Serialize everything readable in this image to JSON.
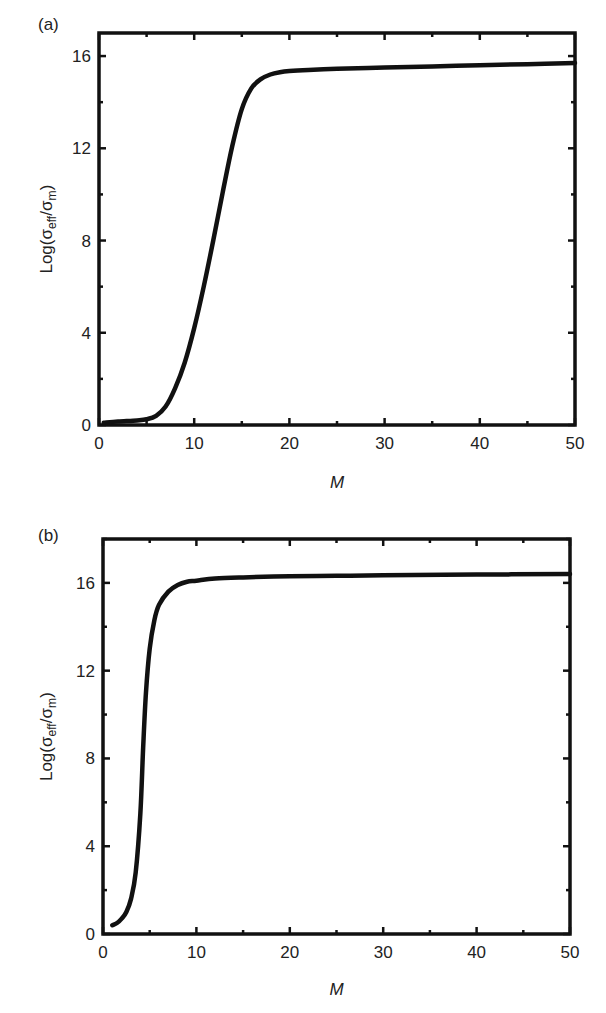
{
  "chart_data": [
    {
      "panel_label": "(a)",
      "type": "line",
      "title": "",
      "xlabel": "M",
      "ylabel_parts": {
        "base": "Log(σ",
        "sub1": "eff",
        "mid": "/σ",
        "sub2": "m",
        "end": ")"
      },
      "ylabel": "Log(σ_eff/σ_m)",
      "xlim": [
        0,
        50
      ],
      "ylim": [
        0,
        17
      ],
      "xticks": [
        0,
        10,
        20,
        30,
        40,
        50
      ],
      "yticks": [
        0,
        4,
        8,
        12,
        16
      ],
      "grid": false,
      "legend": null,
      "series": [
        {
          "name": "Log(σ_eff/σ_m)",
          "x": [
            0.5,
            2,
            4,
            5,
            6,
            7,
            8,
            9,
            10,
            11,
            12,
            13,
            14,
            15,
            16,
            17,
            18,
            19,
            20,
            22,
            25,
            30,
            35,
            40,
            45,
            50
          ],
          "y": [
            0.1,
            0.15,
            0.2,
            0.25,
            0.4,
            0.8,
            1.6,
            2.7,
            4.2,
            6.0,
            8.0,
            10.1,
            12.1,
            13.7,
            14.6,
            15.0,
            15.2,
            15.3,
            15.35,
            15.4,
            15.45,
            15.5,
            15.55,
            15.6,
            15.65,
            15.7
          ]
        }
      ]
    },
    {
      "panel_label": "(b)",
      "type": "line",
      "title": "",
      "xlabel": "M",
      "ylabel_parts": {
        "base": "Log(σ",
        "sub1": "eff",
        "mid": "/σ",
        "sub2": "m",
        "end": ")"
      },
      "ylabel": "Log(σ_eff/σ_m)",
      "xlim": [
        0,
        50
      ],
      "ylim": [
        0,
        18
      ],
      "xticks": [
        0,
        10,
        20,
        30,
        40,
        50
      ],
      "yticks": [
        0,
        4,
        8,
        12,
        16
      ],
      "grid": false,
      "legend": null,
      "series": [
        {
          "name": "Log(σ_eff/σ_m)",
          "x": [
            1,
            1.5,
            2,
            2.5,
            3,
            3.5,
            4,
            4.3,
            4.6,
            5,
            5.5,
            6,
            7,
            8,
            9,
            10,
            12,
            15,
            20,
            25,
            30,
            40,
            50
          ],
          "y": [
            0.4,
            0.5,
            0.7,
            1.0,
            1.6,
            2.8,
            5.5,
            8.5,
            11.0,
            13.0,
            14.3,
            15.0,
            15.6,
            15.9,
            16.05,
            16.1,
            16.2,
            16.25,
            16.3,
            16.32,
            16.35,
            16.38,
            16.4
          ]
        }
      ]
    }
  ]
}
